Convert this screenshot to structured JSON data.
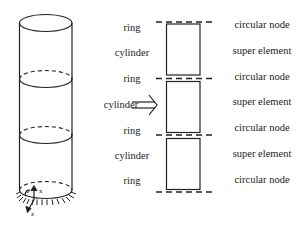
{
  "figure": {
    "left_labels": [
      "ring",
      "cylinder",
      "ring",
      "cylinder",
      "ring",
      "cylinder",
      "ring"
    ],
    "right_labels": [
      "circular node",
      "super element",
      "circular node",
      "super element",
      "circular node",
      "super element",
      "circular node"
    ],
    "arrow": "⇒",
    "axes": {
      "theta": "θ",
      "x": "x",
      "z": "z"
    }
  }
}
